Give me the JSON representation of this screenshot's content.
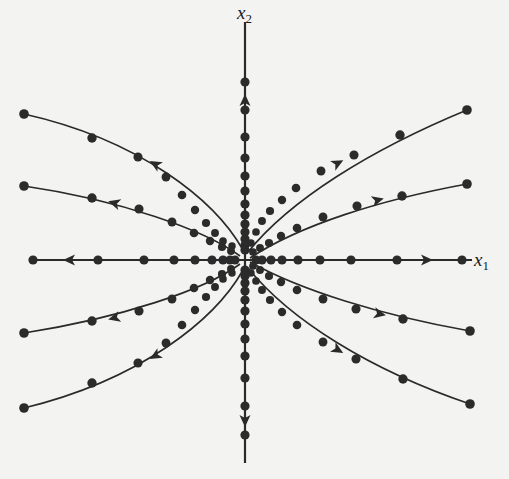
{
  "figure": {
    "type": "phase-portrait",
    "origin": [
      245,
      260
    ],
    "colors": {
      "ink": "#2a2a2a",
      "dot": "#2b2b2b",
      "background": "#f3f3f1"
    },
    "axes": {
      "x": {
        "label_base": "x",
        "label_sub": "1",
        "from": [
          30,
          260
        ],
        "to": [
          472,
          260
        ]
      },
      "y": {
        "label_base": "x",
        "label_sub": "2",
        "from": [
          245,
          22
        ],
        "to": [
          245,
          463
        ]
      }
    },
    "axis_trajectories": [
      {
        "name": "negative-x1-axis",
        "points": [
          [
            245,
            260
          ],
          [
            33,
            260
          ]
        ],
        "dots": [
          [
            33,
            260
          ],
          [
            98,
            260
          ],
          [
            144,
            260
          ],
          [
            174,
            260
          ],
          [
            195,
            260
          ],
          [
            212,
            260
          ],
          [
            223,
            260
          ],
          [
            230,
            260
          ],
          [
            235,
            260
          ]
        ],
        "arrow": {
          "at": [
            69,
            260
          ],
          "direction": "left"
        }
      },
      {
        "name": "positive-x1-axis",
        "points": [
          [
            245,
            260
          ],
          [
            470,
            260
          ]
        ],
        "dots": [
          [
            256,
            260
          ],
          [
            262,
            260
          ],
          [
            271,
            260
          ],
          [
            282,
            260
          ],
          [
            298,
            260
          ],
          [
            320,
            260
          ],
          [
            351,
            260
          ],
          [
            397,
            260
          ],
          [
            462,
            260
          ]
        ],
        "arrow": {
          "at": [
            427,
            260
          ],
          "direction": "right"
        }
      },
      {
        "name": "positive-x2-axis",
        "points": [
          [
            245,
            260
          ],
          [
            245,
            22
          ]
        ],
        "dots": [
          [
            245,
            82
          ],
          [
            245,
            110
          ],
          [
            245,
            137
          ],
          [
            245,
            158
          ],
          [
            245,
            176
          ],
          [
            245,
            191
          ],
          [
            245,
            204
          ],
          [
            245,
            215
          ],
          [
            245,
            224
          ],
          [
            245,
            232
          ],
          [
            245,
            239
          ],
          [
            245,
            245
          ],
          [
            245,
            250
          ]
        ],
        "arrow": {
          "at": [
            245,
            100
          ],
          "direction": "up"
        }
      },
      {
        "name": "negative-x2-axis",
        "points": [
          [
            245,
            260
          ],
          [
            245,
            463
          ]
        ],
        "dots": [
          [
            245,
            270
          ],
          [
            245,
            276
          ],
          [
            245,
            283
          ],
          [
            245,
            291
          ],
          [
            245,
            300
          ],
          [
            245,
            311
          ],
          [
            245,
            324
          ],
          [
            245,
            339
          ],
          [
            245,
            356
          ],
          [
            245,
            378
          ],
          [
            245,
            406
          ],
          [
            245,
            435
          ]
        ],
        "arrow": {
          "at": [
            245,
            421
          ],
          "direction": "down"
        }
      }
    ],
    "trajectories": [
      {
        "name": "q2-upper",
        "path": "M 243 250 C 215 200, 140 140, 24 114",
        "dots": [
          [
            24,
            114
          ],
          [
            92,
            138
          ],
          [
            138,
            157
          ],
          [
            166,
            177
          ],
          [
            182,
            195
          ],
          [
            195,
            210
          ],
          [
            206,
            223
          ],
          [
            215,
            233
          ],
          [
            223,
            241
          ],
          [
            232,
            246
          ]
        ],
        "arrow": {
          "at": [
            155,
            164
          ],
          "angle": 210
        }
      },
      {
        "name": "q2-lower",
        "path": "M 240 256 C 205 230, 120 200, 24 186",
        "dots": [
          [
            24,
            186
          ],
          [
            92,
            198
          ],
          [
            139,
            209
          ],
          [
            172,
            222
          ],
          [
            194,
            233
          ],
          [
            210,
            241
          ],
          [
            222,
            247
          ],
          [
            231,
            251
          ]
        ],
        "arrow": {
          "at": [
            114,
            203
          ],
          "angle": 196
        }
      },
      {
        "name": "q1-upper",
        "path": "M 248 252 C 290 200, 370 150, 467 110",
        "dots": [
          [
            467,
            110
          ],
          [
            400,
            135
          ],
          [
            354,
            155
          ],
          [
            321,
            171
          ],
          [
            296,
            188
          ],
          [
            282,
            200
          ],
          [
            270,
            211
          ],
          [
            262,
            221
          ],
          [
            256,
            232
          ],
          [
            251,
            243
          ]
        ],
        "arrow": {
          "at": [
            338,
            163
          ],
          "angle": -28
        }
      },
      {
        "name": "q1-upper-inner",
        "path": "M 250 258 C 300 225, 380 200, 467 184",
        "dots": [
          [
            467,
            184
          ],
          [
            402,
            196
          ],
          [
            357,
            206
          ],
          [
            323,
            217
          ],
          [
            297,
            228
          ],
          [
            281,
            236
          ],
          [
            269,
            243
          ],
          [
            260,
            248
          ],
          [
            253,
            252
          ]
        ],
        "arrow": {
          "at": [
            378,
            200
          ],
          "angle": -15
        }
      },
      {
        "name": "q3-upper",
        "path": "M 240 264 C 205 290, 120 318, 24 333",
        "dots": [
          [
            24,
            333
          ],
          [
            92,
            321
          ],
          [
            139,
            311
          ],
          [
            172,
            299
          ],
          [
            194,
            288
          ],
          [
            210,
            280
          ],
          [
            222,
            274
          ],
          [
            231,
            269
          ]
        ],
        "arrow": {
          "at": [
            114,
            318
          ],
          "angle": 165
        }
      },
      {
        "name": "q3-lower",
        "path": "M 243 270 C 215 320, 140 380, 24 408",
        "dots": [
          [
            24,
            408
          ],
          [
            92,
            383
          ],
          [
            138,
            363
          ],
          [
            166,
            343
          ],
          [
            182,
            325
          ],
          [
            195,
            310
          ],
          [
            206,
            297
          ],
          [
            215,
            287
          ],
          [
            223,
            279
          ],
          [
            232,
            273
          ]
        ],
        "arrow": {
          "at": [
            155,
            356
          ],
          "angle": 150
        }
      },
      {
        "name": "q4-upper",
        "path": "M 250 262 C 300 290, 380 315, 470 331",
        "dots": [
          [
            470,
            331
          ],
          [
            403,
            319
          ],
          [
            356,
            309
          ],
          [
            323,
            299
          ],
          [
            297,
            290
          ],
          [
            281,
            282
          ],
          [
            269,
            276
          ],
          [
            260,
            270
          ],
          [
            253,
            266
          ]
        ],
        "arrow": {
          "at": [
            380,
            314
          ],
          "angle": 12
        }
      },
      {
        "name": "q4-lower",
        "path": "M 248 268 C 290 320, 370 370, 470 404",
        "dots": [
          [
            470,
            404
          ],
          [
            403,
            379
          ],
          [
            356,
            359
          ],
          [
            323,
            342
          ],
          [
            297,
            325
          ],
          [
            282,
            312
          ],
          [
            270,
            300
          ],
          [
            262,
            290
          ],
          [
            256,
            281
          ],
          [
            251,
            273
          ]
        ],
        "arrow": {
          "at": [
            338,
            350
          ],
          "angle": 30
        }
      }
    ]
  }
}
